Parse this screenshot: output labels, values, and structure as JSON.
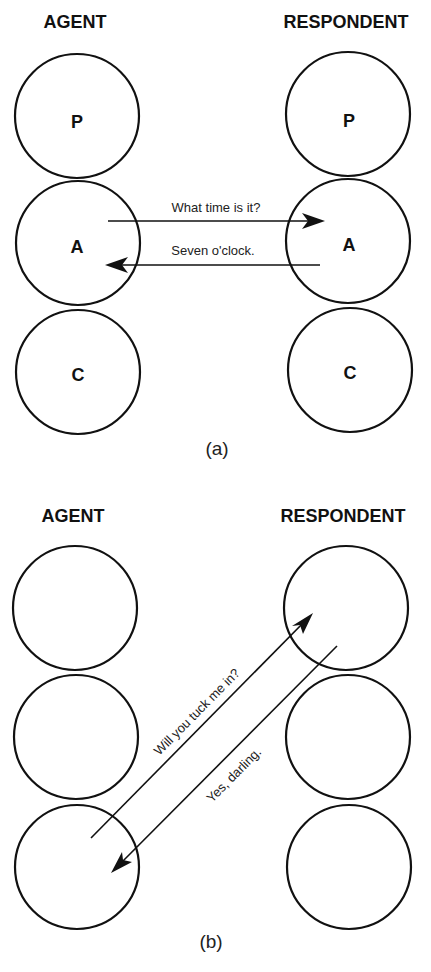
{
  "panels": [
    {
      "caption": "(a)",
      "agent_label": "AGENT",
      "respondent_label": "RESPONDENT",
      "agent_states": [
        "P",
        "A",
        "C"
      ],
      "respondent_states": [
        "P",
        "A",
        "C"
      ],
      "transactions": [
        {
          "from": "agent.A",
          "to": "respondent.A",
          "message": "What time is it?"
        },
        {
          "from": "respondent.A",
          "to": "agent.A",
          "message": "Seven o'clock."
        }
      ]
    },
    {
      "caption": "(b)",
      "agent_label": "AGENT",
      "respondent_label": "RESPONDENT",
      "agent_states": [
        "",
        "",
        ""
      ],
      "respondent_states": [
        "",
        "",
        ""
      ],
      "transactions": [
        {
          "from": "agent.C",
          "to": "respondent.P",
          "message": "Will you tuck me in?"
        },
        {
          "from": "respondent.P",
          "to": "agent.C",
          "message": "Yes, darling."
        }
      ]
    }
  ]
}
